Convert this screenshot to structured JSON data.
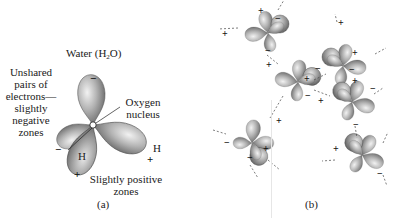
{
  "panel_a": {
    "title_prefix": "Water (H",
    "title_sub": "2",
    "title_suffix": "O)",
    "label_unshared": [
      "Unshared",
      "pairs of",
      "electrons—",
      "slightly",
      "negative",
      "zones"
    ],
    "label_oxygen": [
      "Oxygen",
      "nucleus"
    ],
    "label_positive": [
      "Slightly positive",
      "zones"
    ],
    "atom_h_left": "H",
    "atom_h_right": "H",
    "atom_o": "O",
    "charge_neg": "−",
    "charge_pos": "+",
    "caption": "(a)"
  },
  "panel_b": {
    "caption": "(b)",
    "molecule_count": 6
  },
  "colors": {
    "lobe_dark": "#6e6e6e",
    "lobe_mid": "#a8a8a8",
    "lobe_light": "#e2e2e2",
    "text": "#1a1a1a"
  }
}
